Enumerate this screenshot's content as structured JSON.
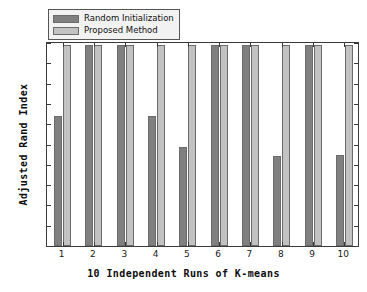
{
  "chart_data": {
    "type": "bar",
    "title": "",
    "xlabel": "10 Independent Runs of K-means",
    "ylabel": "Adjusted Rand Index",
    "categories": [
      "1",
      "2",
      "3",
      "4",
      "5",
      "6",
      "7",
      "8",
      "9",
      "10"
    ],
    "series": [
      {
        "name": "Random Initialization",
        "color": "#808080",
        "values": [
          0.64,
          0.99,
          0.99,
          0.64,
          0.49,
          0.99,
          0.99,
          0.445,
          0.99,
          0.45
        ]
      },
      {
        "name": "Proposed Method",
        "color": "#c2c2c2",
        "values": [
          0.99,
          0.99,
          0.99,
          0.99,
          0.99,
          0.99,
          0.99,
          0.99,
          0.99,
          0.99
        ]
      }
    ],
    "ylim": [
      0,
      1
    ],
    "yticks": [
      "0",
      "0.1",
      "0.2",
      "0.3",
      "0.4",
      "0.5",
      "0.6",
      "0.7",
      "0.8",
      "0.9",
      "1"
    ],
    "ytick_values": [
      0,
      0.1,
      0.2,
      0.3,
      0.4,
      0.5,
      0.6,
      0.7,
      0.8,
      0.9,
      1
    ],
    "grid": false,
    "legend_position": "top-left",
    "bar_edge_color": "#6b6b6b",
    "axis_color": "#3a3a3a",
    "background": "#ffffff"
  }
}
